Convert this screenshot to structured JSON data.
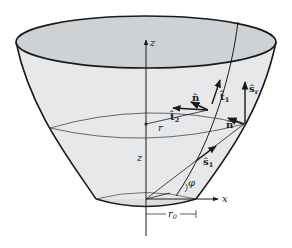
{
  "figure": {
    "colors": {
      "background": "#ffffff",
      "surface_fill": "#e6e8ea",
      "top_ellipse_fill": "#cfd2d5",
      "outline": "#1a1a1a",
      "thin_line": "#333333"
    },
    "labels": {
      "z_axis_top": "z",
      "z_axis_mid": "z",
      "x_axis": "x",
      "r": "r",
      "r0": "r",
      "r0_sub": "0",
      "phi": "φ",
      "n_hat_1": "n̂",
      "n_hat_2": "n̂",
      "t1_hat": "t̂",
      "t1_sub": "1",
      "t2_hat": "t̂",
      "t2_sub": "2",
      "sr_hat": "ŝ",
      "sr_sub": "r",
      "s1_hat": "ŝ",
      "s1_sub": "1"
    }
  }
}
